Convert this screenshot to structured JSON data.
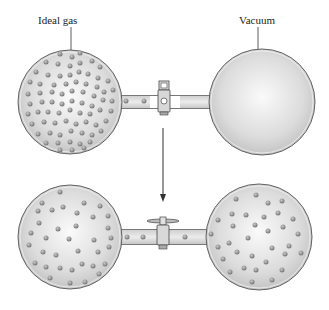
{
  "diagram": {
    "labels": {
      "left_bulb": "Ideal gas",
      "right_bulb": "Vacuum"
    },
    "states": [
      {
        "name": "initial",
        "valve": "closed",
        "left": "ideal gas (particles)",
        "right": "vacuum (empty)"
      },
      {
        "name": "final",
        "valve": "open",
        "left": "gas particles spread",
        "right": "gas particles spread"
      }
    ],
    "colors": {
      "glass_outline": "#555555",
      "glass_fill": "#d4d4d4",
      "glass_highlight": "#f7f7f7",
      "particle": "#8c8c8c",
      "arrow": "#333333"
    }
  }
}
